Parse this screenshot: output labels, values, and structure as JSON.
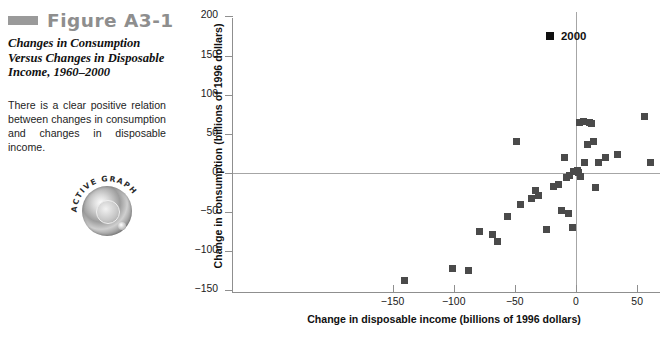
{
  "figure": {
    "number": "Figure A3-1",
    "title": "Changes in Consumption Versus Changes in Disposable Income, 1960–2000",
    "caption": "There is a clear positive relation between changes in consumption and changes in disposable income.",
    "badge_label": "ACTIVE GRAPH"
  },
  "legend": {
    "label": "2000",
    "marker_color": "#0f0f0f"
  },
  "colors": {
    "marker": "#4a4a4a",
    "axis": "#8f8f8f",
    "zero_line": "#a6a6a6",
    "figure_number": "#8e8e8e",
    "rule": "#9a9a9a"
  },
  "chart_data": {
    "type": "scatter",
    "title": "Changes in Consumption Versus Changes in Disposable Income, 1960–2000",
    "xlabel": "Change in disposable income (billions of 1996 dollars)",
    "ylabel": "Change in consumption (billions of 1996 dollars)",
    "xlim": [
      -150,
      200
    ],
    "ylim": [
      -150,
      200
    ],
    "xticks": [
      -150,
      -100,
      -50,
      0,
      50,
      100,
      150,
      200
    ],
    "yticks": [
      -150,
      -100,
      -50,
      0,
      50,
      100,
      150,
      200
    ],
    "xtick_labels": [
      "−150",
      "−100",
      "−50",
      "0",
      "50",
      "100",
      "150",
      "200"
    ],
    "ytick_labels": [
      "−150",
      "−100",
      "−50",
      "0",
      "50",
      "100",
      "150",
      "200"
    ],
    "grid": false,
    "zero_lines": true,
    "legend": {
      "position": "top-right",
      "entries": [
        {
          "name": "2000",
          "marker": "square",
          "color": "#0f0f0f"
        }
      ]
    },
    "series": [
      {
        "name": "Annual changes 1960-2000",
        "marker": "square",
        "color": "#4a4a4a",
        "points": [
          {
            "x": -140,
            "y": -137
          },
          {
            "x": -101,
            "y": -122
          },
          {
            "x": -88,
            "y": -124
          },
          {
            "x": -79,
            "y": -75
          },
          {
            "x": -68,
            "y": -78
          },
          {
            "x": -64,
            "y": -88
          },
          {
            "x": -56,
            "y": -55
          },
          {
            "x": -49,
            "y": 40
          },
          {
            "x": -45,
            "y": -40
          },
          {
            "x": -36,
            "y": -33
          },
          {
            "x": -33,
            "y": -22
          },
          {
            "x": -31,
            "y": -29
          },
          {
            "x": -24,
            "y": -72
          },
          {
            "x": -18,
            "y": -17
          },
          {
            "x": -14,
            "y": -15
          },
          {
            "x": -12,
            "y": -48
          },
          {
            "x": -9,
            "y": 20
          },
          {
            "x": -8,
            "y": -6
          },
          {
            "x": -6,
            "y": -52
          },
          {
            "x": -5,
            "y": -3
          },
          {
            "x": -3,
            "y": -70
          },
          {
            "x": -2,
            "y": 2
          },
          {
            "x": 1,
            "y": 3
          },
          {
            "x": 2,
            "y": 1
          },
          {
            "x": 3,
            "y": 65
          },
          {
            "x": 4,
            "y": -5
          },
          {
            "x": 6,
            "y": 66
          },
          {
            "x": 7,
            "y": 14
          },
          {
            "x": 9,
            "y": 36
          },
          {
            "x": 11,
            "y": 64
          },
          {
            "x": 13,
            "y": 63
          },
          {
            "x": 14,
            "y": 40
          },
          {
            "x": 16,
            "y": -18
          },
          {
            "x": 18,
            "y": 14
          },
          {
            "x": 24,
            "y": 20
          },
          {
            "x": 34,
            "y": 23
          },
          {
            "x": 56,
            "y": 72
          },
          {
            "x": 61,
            "y": 14
          },
          {
            "x": 80,
            "y": 52
          },
          {
            "x": 81,
            "y": 70
          },
          {
            "x": 161,
            "y": 140
          },
          {
            "x": 189,
            "y": 71
          }
        ]
      },
      {
        "name": "2000",
        "marker": "square",
        "color": "#333333",
        "points": [
          {
            "x": 161,
            "y": 140
          }
        ]
      }
    ]
  }
}
